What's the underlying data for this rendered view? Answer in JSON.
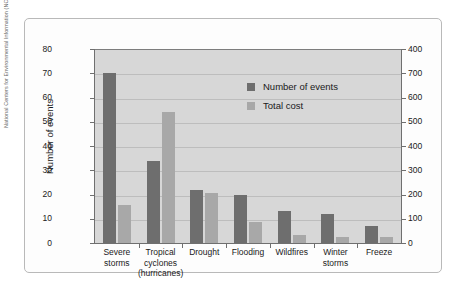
{
  "credit": "National Centers for Environmental Information (NCEI)",
  "legend": {
    "events_label": "Number of events",
    "cost_label": "Total cost"
  },
  "colors": {
    "events_bar": "#6e6e6e",
    "cost_bar": "#a8a8a8",
    "plot_background": "#d7d7d7",
    "gridline": "#bdbdbd",
    "axis": "#6f6f6f"
  },
  "chart_data": {
    "type": "bar",
    "title": "",
    "xlabel": "",
    "ylabel": "Number of events",
    "y2label": "Total cost (billions of dollars)",
    "grid": true,
    "legend_position": "upper-center-right",
    "categories": [
      "Severe storms",
      "Tropical cyclones (hurricanes)",
      "Drought",
      "Flooding",
      "Wildfires",
      "Winter storms",
      "Freeze"
    ],
    "category_label_lines": [
      [
        "Severe",
        "storms"
      ],
      [
        "Tropical",
        "cyclones",
        "(hurricanes)"
      ],
      [
        "Drought"
      ],
      [
        "Flooding"
      ],
      [
        "Wildfires"
      ],
      [
        "Winter",
        "storms"
      ],
      [
        "Freeze"
      ]
    ],
    "ylim": [
      0,
      80
    ],
    "yticks": [
      0,
      10,
      20,
      30,
      40,
      50,
      60,
      70,
      80
    ],
    "yticklabels": [
      "0",
      "10",
      "20",
      "30",
      "40",
      "50",
      "60",
      "70",
      "80"
    ],
    "y2lim": [
      0,
      800
    ],
    "y2ticks": [
      0,
      100,
      200,
      300,
      400,
      500,
      600,
      700,
      800
    ],
    "y2ticklabels": [
      "0",
      "100",
      "200",
      "300",
      "400",
      "500",
      "600",
      "700",
      "400"
    ],
    "series": [
      {
        "name": "Number of events",
        "axis": "left",
        "units": "events",
        "values": [
          70,
          34,
          22,
          20,
          13,
          12,
          7
        ]
      },
      {
        "name": "Total cost",
        "axis": "right",
        "units": "billions of dollars",
        "values": [
          155,
          540,
          205,
          85,
          35,
          25,
          25
        ]
      }
    ]
  }
}
